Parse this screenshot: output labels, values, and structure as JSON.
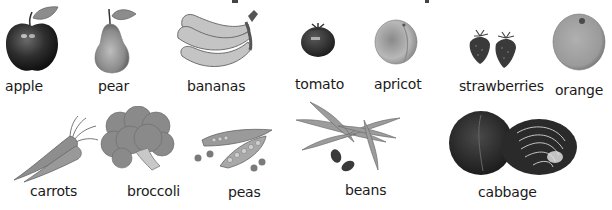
{
  "page": {
    "title_visible": false
  },
  "row1": [
    {
      "id": "apple",
      "label": "apple"
    },
    {
      "id": "pear",
      "label": "pear"
    },
    {
      "id": "bananas",
      "label": "bananas"
    },
    {
      "id": "tomato",
      "label": "tomato"
    },
    {
      "id": "apricot",
      "label": "apricot"
    },
    {
      "id": "strawberries",
      "label": "strawberries"
    },
    {
      "id": "orange",
      "label": "orange"
    }
  ],
  "row2": [
    {
      "id": "carrots",
      "label": "carrots"
    },
    {
      "id": "broccoli",
      "label": "broccoli"
    },
    {
      "id": "peas",
      "label": "peas"
    },
    {
      "id": "beans",
      "label": "beans"
    },
    {
      "id": "cabbage",
      "label": "cabbage"
    }
  ],
  "colors": {
    "dark": "#2b2b2b",
    "mid": "#7a7a7a",
    "light": "#b5b5b5",
    "label": "#1a1a1a"
  }
}
